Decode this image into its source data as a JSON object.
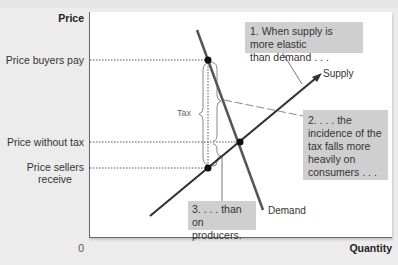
{
  "diagram": {
    "title_cropped": "",
    "y_axis": {
      "title": "Price",
      "labels": [
        {
          "text": "Price buyers pay",
          "y": 60
        },
        {
          "text": "Price without tax",
          "y": 142
        },
        {
          "text": "Price sellers receive",
          "line1": "Price sellers",
          "line2": "receive",
          "y": 168
        }
      ]
    },
    "x_axis": {
      "title": "Quantity",
      "origin": "0"
    },
    "curves": {
      "supply": {
        "label": "Supply",
        "color": "#444444"
      },
      "demand": {
        "label": "Demand",
        "color": "#555555"
      }
    },
    "tax": {
      "label": "Tax"
    },
    "callouts": [
      {
        "id": "1",
        "line1": "1. When supply is more elastic",
        "line2": "than demand . . ."
      },
      {
        "id": "2",
        "lines": [
          "2. . . . the",
          "incidence of the",
          "tax falls more",
          "heavily on",
          "consumers . . ."
        ]
      },
      {
        "id": "3",
        "line1": "3. . . . than",
        "line2": "on producers."
      }
    ],
    "points": {
      "buyers_pay": {
        "x": 208,
        "y": 60
      },
      "equilibrium": {
        "x": 240,
        "y": 142
      },
      "sellers_receive": {
        "x": 208,
        "y": 168
      }
    },
    "colors": {
      "callout_bg": "#cfcfcf",
      "plot_bg": "#ffffff",
      "page_bg": "#ececec"
    }
  }
}
